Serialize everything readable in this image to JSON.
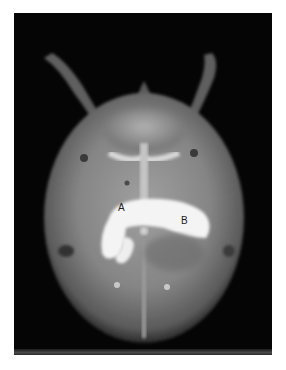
{
  "figure": {
    "type": "radiograph",
    "labels": [
      {
        "id": "A",
        "text": "A"
      },
      {
        "id": "B",
        "text": "B"
      }
    ],
    "colors": {
      "background": "#050505",
      "contrast": "#f4f4f4",
      "tissue": "#8c8c8c"
    }
  }
}
